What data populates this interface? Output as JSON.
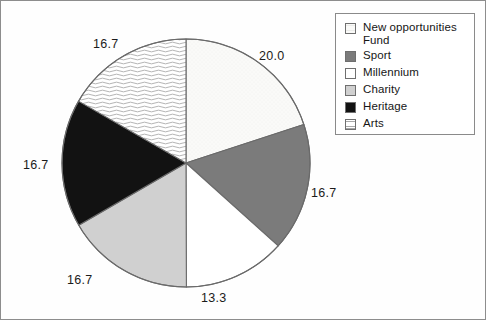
{
  "chart_data": {
    "type": "pie",
    "title": "",
    "xlabel": "",
    "ylabel": "",
    "total": 100.0,
    "start_angle_deg": 90,
    "direction": "clockwise",
    "center": [
      185,
      162
    ],
    "radius": 124,
    "legend_position": "right",
    "grid": false,
    "categories": [
      "New opportunities Fund",
      "Sport",
      "Millennium",
      "Charity",
      "Heritage",
      "Arts"
    ],
    "values": [
      20.0,
      16.7,
      13.3,
      16.7,
      16.7,
      16.7
    ],
    "labels": [
      "20.0",
      "16.7",
      "13.3",
      "16.7",
      "16.7",
      "16.7"
    ],
    "slices": [
      {
        "name": "New opportunities Fund",
        "value": 20.0,
        "label": "20.0",
        "fill": "#f7f7f5",
        "pattern": "stipple-very-light",
        "stroke": "#6a6a6a",
        "label_x": 258,
        "label_y": 48
      },
      {
        "name": "Sport",
        "value": 16.7,
        "label": "16.7",
        "fill": "#7b7b7b",
        "pattern": "solid",
        "stroke": "#6a6a6a",
        "label_x": 310,
        "label_y": 185
      },
      {
        "name": "Millennium",
        "value": 13.3,
        "label": "13.3",
        "fill": "#ffffff",
        "pattern": "solid",
        "stroke": "#6a6a6a",
        "label_x": 200,
        "label_y": 290
      },
      {
        "name": "Charity",
        "value": 16.7,
        "label": "16.7",
        "fill": "#d0d0d0",
        "pattern": "solid",
        "stroke": "#6a6a6a",
        "label_x": 66,
        "label_y": 272
      },
      {
        "name": "Heritage",
        "value": 16.7,
        "label": "16.7",
        "fill": "#121212",
        "pattern": "solid",
        "stroke": "#6a6a6a",
        "label_x": 22,
        "label_y": 157
      },
      {
        "name": "Arts",
        "value": 16.7,
        "label": "16.7",
        "fill": "#fbfbfb",
        "pattern": "horizontal-wavy-lines",
        "stroke": "#6a6a6a",
        "label_x": 92,
        "label_y": 36
      }
    ]
  },
  "legend": {
    "items": [
      {
        "label_line1": "New opportunities",
        "label_line2": "Fund",
        "swatch": "#f7f7f5",
        "pattern": "stipple-very-light"
      },
      {
        "label_line1": "Sport",
        "label_line2": "",
        "swatch": "#7b7b7b",
        "pattern": "solid"
      },
      {
        "label_line1": "Millennium",
        "label_line2": "",
        "swatch": "#ffffff",
        "pattern": "solid"
      },
      {
        "label_line1": "Charity",
        "label_line2": "",
        "swatch": "#d0d0d0",
        "pattern": "solid"
      },
      {
        "label_line1": "Heritage",
        "label_line2": "",
        "swatch": "#121212",
        "pattern": "solid"
      },
      {
        "label_line1": "Arts",
        "label_line2": "",
        "swatch": "#fbfbfb",
        "pattern": "horizontal-wavy-lines"
      }
    ]
  },
  "colors": {
    "outline": "#6a6a6a",
    "legend_border": "#8a8a8a",
    "frame_border": "#8d8d8d",
    "text": "#161616",
    "background": "#fefefe"
  }
}
